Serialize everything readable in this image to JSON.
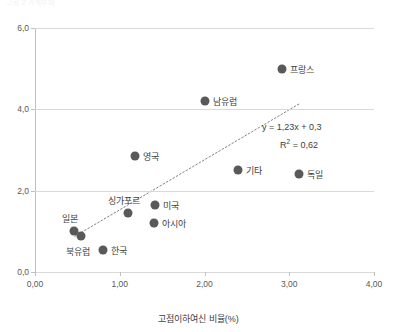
{
  "chart_title_faint": "그림 2 가계부채",
  "chart_data": {
    "type": "scatter",
    "title": "",
    "xlabel": "고점이하여신 비율(%)",
    "ylabel": "",
    "xlim": [
      0.0,
      4.0
    ],
    "ylim": [
      0.0,
      6.0
    ],
    "xticks": [
      "0,00",
      "1,00",
      "2,00",
      "3,00",
      "4,00"
    ],
    "xtick_values": [
      0.0,
      1.0,
      2.0,
      3.0,
      4.0
    ],
    "yticks": [
      "0,0",
      "2,0",
      "4,0",
      "6,0"
    ],
    "ytick_values": [
      0.0,
      2.0,
      4.0,
      6.0
    ],
    "grid": "horizontal",
    "legend": "none",
    "marker_color": "#595959",
    "trendline": {
      "equation": "y = 1,23x + 0,3",
      "r2": "R² = 0,62",
      "slope": 1.23,
      "intercept": 0.3,
      "r_squared": 0.62,
      "style": "dotted",
      "color": "#808080",
      "x_start": 0.47,
      "x_end": 3.13
    },
    "points": [
      {
        "label": "프랑스",
        "x": 2.92,
        "y": 5.0,
        "label_pos": "right"
      },
      {
        "label": "남유럽",
        "x": 2.0,
        "y": 4.2,
        "label_pos": "right"
      },
      {
        "label": "영국",
        "x": 1.18,
        "y": 2.85,
        "label_pos": "right"
      },
      {
        "label": "기타",
        "x": 2.4,
        "y": 2.5,
        "label_pos": "right"
      },
      {
        "label": "독일",
        "x": 3.12,
        "y": 2.4,
        "label_pos": "right"
      },
      {
        "label": "싱가포르",
        "x": 1.1,
        "y": 1.45,
        "label_pos": "above-left"
      },
      {
        "label": "미국",
        "x": 1.42,
        "y": 1.65,
        "label_pos": "right"
      },
      {
        "label": "아시아",
        "x": 1.4,
        "y": 1.2,
        "label_pos": "right"
      },
      {
        "label": "일본",
        "x": 0.46,
        "y": 1.0,
        "label_pos": "above-left"
      },
      {
        "label": "북유럽",
        "x": 0.54,
        "y": 0.88,
        "label_pos": "below-left"
      },
      {
        "label": "한국",
        "x": 0.8,
        "y": 0.55,
        "label_pos": "right"
      }
    ]
  }
}
